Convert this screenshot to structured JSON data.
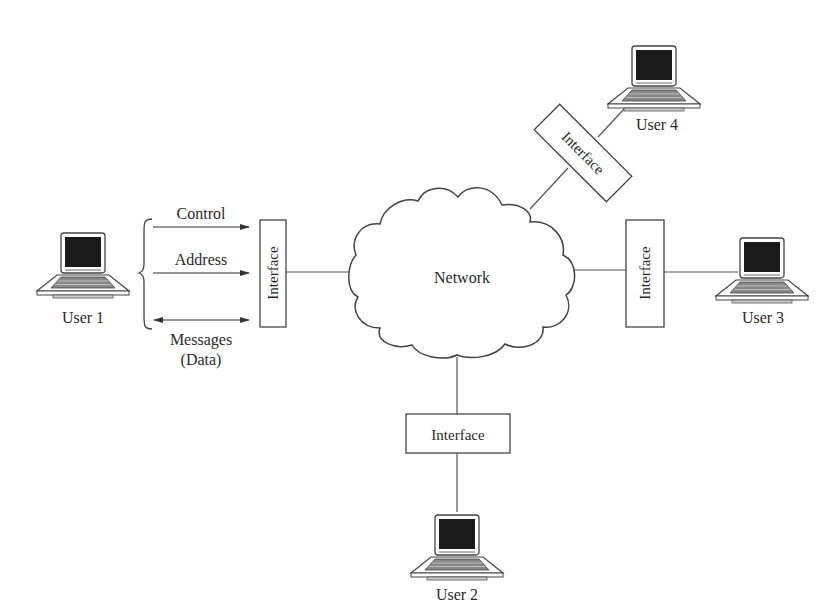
{
  "diagram": {
    "type": "network-interface-diagram",
    "center": {
      "label": "Network"
    },
    "users": [
      {
        "id": "user1",
        "label": "User 1"
      },
      {
        "id": "user2",
        "label": "User 2"
      },
      {
        "id": "user3",
        "label": "User 3"
      },
      {
        "id": "user4",
        "label": "User 4"
      }
    ],
    "interfaces": [
      {
        "id": "if1",
        "label": "Interface",
        "connects": "user1"
      },
      {
        "id": "if2",
        "label": "Interface",
        "connects": "user2"
      },
      {
        "id": "if3",
        "label": "Interface",
        "connects": "user3"
      },
      {
        "id": "if4",
        "label": "Interface",
        "connects": "user4"
      }
    ],
    "signals": [
      {
        "label": "Control",
        "direction": "to-interface"
      },
      {
        "label": "Address",
        "direction": "to-interface"
      },
      {
        "label": "Messages",
        "sublabel": "(Data)",
        "direction": "bidirectional"
      }
    ],
    "colors": {
      "line": "#444444",
      "screen": "#1a1a1a",
      "text": "#2a2a2a"
    }
  }
}
